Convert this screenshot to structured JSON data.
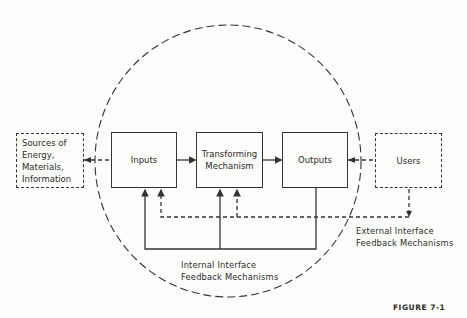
{
  "diagram": {
    "nodes": [
      {
        "id": "sources",
        "label": "Sources of\nEnergy,\nMaterials,\nInformation",
        "style": "dashed"
      },
      {
        "id": "inputs",
        "label": "Inputs",
        "style": "solid"
      },
      {
        "id": "transforming",
        "label": "Transforming\nMechanism",
        "style": "solid"
      },
      {
        "id": "outputs",
        "label": "Outputs",
        "style": "solid"
      },
      {
        "id": "users",
        "label": "Users",
        "style": "dashed"
      }
    ],
    "edges": [
      {
        "from": "sources",
        "to": "inputs",
        "style": "dashed"
      },
      {
        "from": "inputs",
        "to": "transforming",
        "style": "solid"
      },
      {
        "from": "transforming",
        "to": "outputs",
        "style": "solid"
      },
      {
        "from": "outputs",
        "to": "users",
        "style": "dashed"
      },
      {
        "from": "outputs",
        "to": "inputs",
        "style": "solid",
        "via": "internal feedback"
      },
      {
        "from": "outputs",
        "to": "transforming",
        "style": "solid",
        "via": "internal feedback"
      },
      {
        "from": "users",
        "to": "inputs",
        "style": "dashed",
        "via": "external feedback"
      },
      {
        "from": "users",
        "to": "transforming",
        "style": "dashed",
        "via": "external feedback"
      }
    ],
    "boundary": "dashed circle (system boundary)",
    "internal_label": "Internal Interface\nFeedback Mechanisms",
    "external_label": "External Interface\nFeedback Mechanisms",
    "figure_label": "FIGURE 7-1"
  }
}
